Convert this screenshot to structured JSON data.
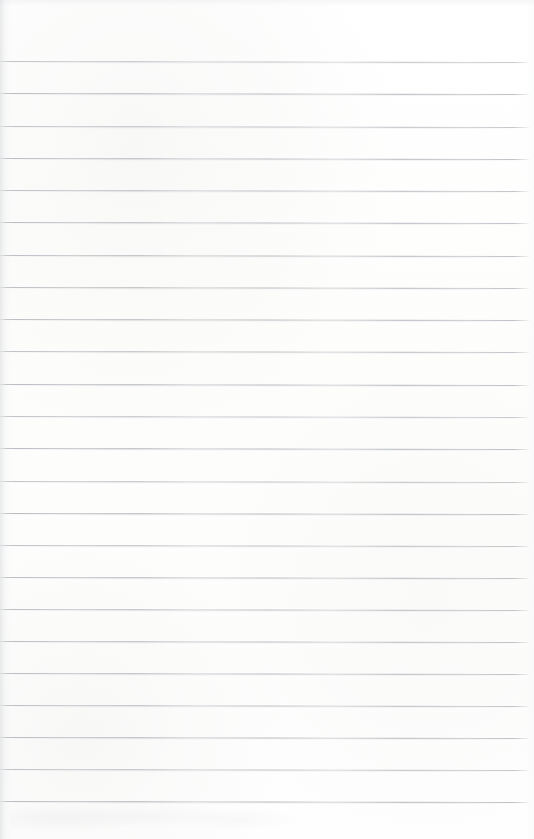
{
  "document": {
    "type": "scanned-blank-lined-paper",
    "title": "",
    "content_text": "",
    "has_handwriting": false,
    "has_printed_text": false,
    "page_width": 534,
    "page_height": 839
  },
  "paper": {
    "background_color": "#fefefe",
    "base_tint": "#fdfdfc",
    "edge_shadow_color": "#d7d9db",
    "smudge_color": "#f0f0f0"
  },
  "ruling": {
    "style": "horizontal-ruled",
    "line_color": "#b4b8bd",
    "line_thickness_px": 1,
    "line_count": 24,
    "first_line_y": 61,
    "line_spacing_px": 32.2,
    "line_start_x": 0,
    "line_end_x": 529,
    "tilt_degrees": 0.12,
    "top_margin_px": 60,
    "bottom_margin_px": 38,
    "right_margin_px": 5,
    "has_vertical_margin_rule": false,
    "has_hole_punches": false,
    "line_y_positions": [
      61,
      93,
      126,
      158,
      190,
      222,
      255,
      287,
      319,
      351,
      384,
      416,
      448,
      481,
      513,
      545,
      577,
      609,
      641,
      673,
      705,
      737,
      769,
      801
    ]
  }
}
